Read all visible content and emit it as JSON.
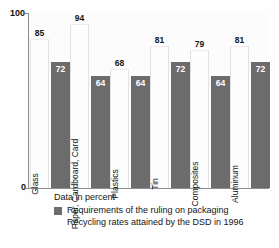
{
  "chart_data": {
    "type": "bar",
    "title": "",
    "subtitle": "",
    "xlabel": "",
    "ylabel": "",
    "ylim": [
      0,
      100
    ],
    "ytick_labels": [
      "0",
      "100"
    ],
    "grid": false,
    "legend_position": "bottom",
    "units_note": "Data in percent",
    "categories": [
      "Glass",
      "Paper, Cardboard, Card",
      "Plastics",
      "Tin",
      "Composites",
      "Aluminum"
    ],
    "series": [
      {
        "name": "Recycling rates attained by the DSD in 1996",
        "style": "light",
        "color": "#fdfdfd",
        "values": [
          85,
          94,
          68,
          81,
          79,
          81
        ]
      },
      {
        "name": "Requirements of the ruling on packaging",
        "style": "dark",
        "color": "#6c6c6c",
        "values": [
          72,
          64,
          64,
          72,
          64,
          72
        ]
      }
    ]
  },
  "axis": {
    "y_max_label": "100",
    "y_min_label": "0"
  },
  "legend": {
    "units": "Data in percent",
    "entries": [
      "Requirements of the ruling on packaging",
      "Recycling rates attained by the DSD in 1996"
    ],
    "swatch_color": "#6c6c6c"
  }
}
